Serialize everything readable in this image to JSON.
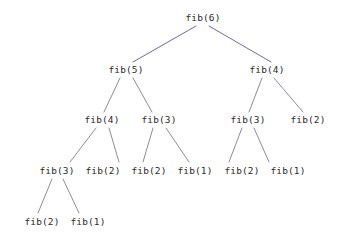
{
  "diagram": {
    "background_color": "#ffffff",
    "node_text_color": "#2b2b2b",
    "edge_color_upper": "#6b6b9e",
    "edge_color_lower": "#8c8c9c",
    "nodes": [
      {
        "id": "n0",
        "label": "fib(6)",
        "level": 0,
        "x": 203,
        "y": 17
      },
      {
        "id": "n1",
        "label": "fib(5)",
        "level": 1,
        "x": 126,
        "y": 69
      },
      {
        "id": "n2",
        "label": "fib(4)",
        "level": 1,
        "x": 267,
        "y": 69
      },
      {
        "id": "n3",
        "label": "fib(4)",
        "level": 2,
        "x": 102,
        "y": 119
      },
      {
        "id": "n4",
        "label": "fib(3)",
        "level": 2,
        "x": 159,
        "y": 119
      },
      {
        "id": "n5",
        "label": "fib(3)",
        "level": 2,
        "x": 248,
        "y": 119
      },
      {
        "id": "n6",
        "label": "fib(2)",
        "level": 2,
        "x": 308,
        "y": 119
      },
      {
        "id": "n7",
        "label": "fib(3)",
        "level": 3,
        "x": 57,
        "y": 170
      },
      {
        "id": "n8",
        "label": "fib(2)",
        "level": 3,
        "x": 103,
        "y": 170
      },
      {
        "id": "n9",
        "label": "fib(2)",
        "level": 3,
        "x": 149,
        "y": 170
      },
      {
        "id": "n10",
        "label": "fib(1)",
        "level": 3,
        "x": 195,
        "y": 170
      },
      {
        "id": "n11",
        "label": "fib(2)",
        "level": 3,
        "x": 242,
        "y": 170
      },
      {
        "id": "n12",
        "label": "fib(1)",
        "level": 3,
        "x": 288,
        "y": 170
      },
      {
        "id": "n13",
        "label": "fib(2)",
        "level": 4,
        "x": 42,
        "y": 221
      },
      {
        "id": "n14",
        "label": "fib(1)",
        "level": 4,
        "x": 88,
        "y": 221
      }
    ],
    "edges": [
      {
        "from": "n0",
        "to": "n1",
        "x1": 196,
        "y1": 26,
        "x2": 133,
        "y2": 62,
        "color": "#6b6b9e"
      },
      {
        "from": "n0",
        "to": "n2",
        "x1": 209,
        "y1": 26,
        "x2": 271,
        "y2": 62,
        "color": "#6b6b9e"
      },
      {
        "from": "n1",
        "to": "n3",
        "x1": 120,
        "y1": 78,
        "x2": 104,
        "y2": 112,
        "color": "#8c8c9c"
      },
      {
        "from": "n1",
        "to": "n4",
        "x1": 133,
        "y1": 78,
        "x2": 152,
        "y2": 112,
        "color": "#8c8c9c"
      },
      {
        "from": "n2",
        "to": "n5",
        "x1": 262,
        "y1": 78,
        "x2": 249,
        "y2": 112,
        "color": "#8c8c9c"
      },
      {
        "from": "n2",
        "to": "n6",
        "x1": 274,
        "y1": 78,
        "x2": 303,
        "y2": 112,
        "color": "#8c8c9c"
      },
      {
        "from": "n3",
        "to": "n7",
        "x1": 96,
        "y1": 128,
        "x2": 70,
        "y2": 162,
        "color": "#8c8c9c"
      },
      {
        "from": "n3",
        "to": "n8",
        "x1": 109,
        "y1": 128,
        "x2": 119,
        "y2": 162,
        "color": "#8c8c9c"
      },
      {
        "from": "n4",
        "to": "n9",
        "x1": 153,
        "y1": 128,
        "x2": 143,
        "y2": 162,
        "color": "#8c8c9c"
      },
      {
        "from": "n4",
        "to": "n10",
        "x1": 166,
        "y1": 128,
        "x2": 189,
        "y2": 162,
        "color": "#8c8c9c"
      },
      {
        "from": "n5",
        "to": "n11",
        "x1": 242,
        "y1": 128,
        "x2": 229,
        "y2": 162,
        "color": "#8c8c9c"
      },
      {
        "from": "n5",
        "to": "n12",
        "x1": 254,
        "y1": 128,
        "x2": 269,
        "y2": 162,
        "color": "#8c8c9c"
      },
      {
        "from": "n7",
        "to": "n13",
        "x1": 52,
        "y1": 179,
        "x2": 38,
        "y2": 213,
        "color": "#8c8c9c"
      },
      {
        "from": "n7",
        "to": "n14",
        "x1": 63,
        "y1": 179,
        "x2": 79,
        "y2": 213,
        "color": "#8c8c9c"
      }
    ]
  }
}
